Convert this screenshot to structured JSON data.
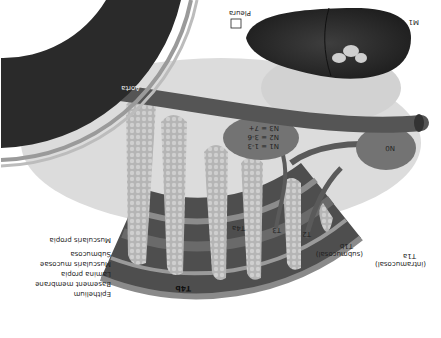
{
  "diagram": {
    "orientation": "rotated 180 degrees",
    "palette": {
      "background": "#ffffff",
      "aorta_dark": "#2a2a2a",
      "aorta_mid": "#555555",
      "tumor": "#b8b8b8",
      "wall_dark": "#4a4a4a",
      "fat": "#d6d6d6",
      "liver": "#262626",
      "node": "#707070",
      "vessel": "#5a5a5a"
    },
    "structures": {
      "aorta": "Aorta",
      "pleura": "Pleura",
      "metastasis": "M1",
      "node_n0": "N0"
    },
    "node_staging": [
      {
        "label": "N1 = 1-3"
      },
      {
        "label": "N2 = 3-6"
      },
      {
        "label": "N3 = 7+"
      }
    ],
    "layers": [
      {
        "label": "Epithelium"
      },
      {
        "label": "Basement membrane"
      },
      {
        "label": "Lamina propia"
      },
      {
        "label": "Muscularis mucosae"
      },
      {
        "label": "Submucosa"
      },
      {
        "label": "Muscularis propia"
      }
    ],
    "tumor_stages": [
      {
        "label": "T1a",
        "sub": "(intramucosal)"
      },
      {
        "label": "T1b",
        "sub": "(submucosal)"
      },
      {
        "label": "T2"
      },
      {
        "label": "T3"
      },
      {
        "label": "T4a"
      },
      {
        "label": "T4b"
      }
    ]
  }
}
